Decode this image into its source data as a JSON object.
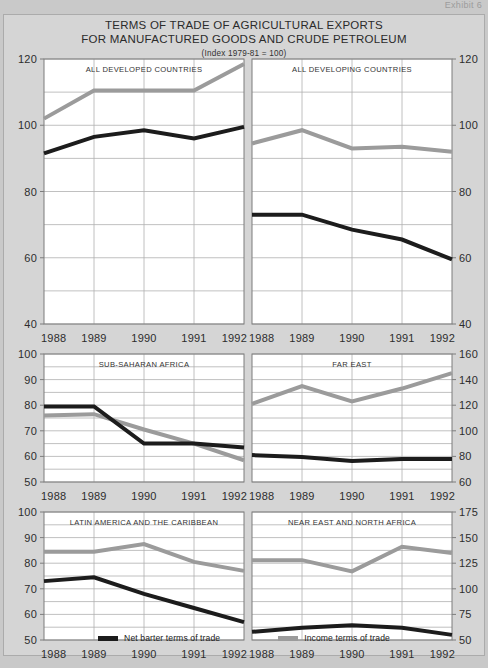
{
  "document": {
    "scan_header": "Exhibit 6",
    "title_line_1": "TERMS OF TRADE OF AGRICULTURAL EXPORTS",
    "title_line_2": "FOR MANUFACTURED GOODS AND CRUDE PETROLEUM",
    "subtitle": "(Index 1979-81 = 100)"
  },
  "colors": {
    "net_barter": "#1c1c1c",
    "income": "#9b9b9b",
    "page_background": "#c9c9c9",
    "sheet_background": "#d5d5d5",
    "plot_background": "#ffffff",
    "grid_line": "#b0b0b0",
    "frame_line": "#7d7d7d",
    "text": "#2b2b2b"
  },
  "legend": {
    "entries": [
      {
        "label": "Net barter terms of trade",
        "color": "#1c1c1c",
        "key": "net_barter"
      },
      {
        "label": "Income terms of trade",
        "color": "#9b9b9b",
        "key": "income"
      }
    ]
  },
  "chart_data": [
    {
      "id": "all-developed-countries",
      "type": "line",
      "title": "ALL DEVELOPED COUNTRIES",
      "xlabel": "",
      "ylabel": "",
      "x": [
        "1988",
        "1989",
        "1990",
        "1991",
        "1992"
      ],
      "ylim": [
        40,
        120
      ],
      "ytick_step": 20,
      "ygrid_step": 10,
      "yticks": [
        40,
        60,
        80,
        100,
        120
      ],
      "y_axis_side": "left",
      "grid": true,
      "legend_position": "figure-bottom",
      "series": [
        {
          "name": "Net barter terms of trade",
          "key": "net_barter",
          "color": "#1c1c1c",
          "values": [
            91.5,
            96.5,
            98.5,
            96.0,
            99.5
          ]
        },
        {
          "name": "Income terms of trade",
          "key": "income",
          "color": "#9b9b9b",
          "values": [
            102.0,
            110.5,
            110.5,
            110.5,
            118.5
          ]
        }
      ]
    },
    {
      "id": "all-developing-countries",
      "type": "line",
      "title": "ALL DEVELOPING COUNTRIES",
      "xlabel": "",
      "ylabel": "",
      "x": [
        "1988",
        "1989",
        "1990",
        "1991",
        "1992"
      ],
      "ylim": [
        40,
        120
      ],
      "ytick_step": 20,
      "ygrid_step": 10,
      "yticks": [
        40,
        60,
        80,
        100,
        120
      ],
      "y_axis_side": "right",
      "grid": true,
      "legend_position": "figure-bottom",
      "series": [
        {
          "name": "Net barter terms of trade",
          "key": "net_barter",
          "color": "#1c1c1c",
          "values": [
            73.0,
            73.0,
            68.5,
            65.5,
            59.5
          ]
        },
        {
          "name": "Income terms of trade",
          "key": "income",
          "color": "#9b9b9b",
          "values": [
            94.5,
            98.5,
            93.0,
            93.5,
            92.0
          ]
        }
      ]
    },
    {
      "id": "sub-saharan-africa",
      "type": "line",
      "title": "SUB-SAHARAN AFRICA",
      "xlabel": "",
      "ylabel": "",
      "x": [
        "1988",
        "1989",
        "1990",
        "1991",
        "1992"
      ],
      "ylim": [
        50,
        100
      ],
      "ytick_step": 10,
      "ygrid_step": 5,
      "yticks": [
        50,
        60,
        70,
        80,
        90,
        100
      ],
      "y_axis_side": "left",
      "grid": true,
      "legend_position": "figure-bottom",
      "series": [
        {
          "name": "Net barter terms of trade",
          "key": "net_barter",
          "color": "#1c1c1c",
          "values": [
            79.5,
            79.5,
            65.0,
            65.0,
            63.5
          ]
        },
        {
          "name": "Income terms of trade",
          "key": "income",
          "color": "#9b9b9b",
          "values": [
            76.0,
            76.5,
            70.5,
            65.0,
            58.5
          ]
        }
      ]
    },
    {
      "id": "far-east",
      "type": "line",
      "title": "FAR EAST",
      "xlabel": "",
      "ylabel": "",
      "x": [
        "1988",
        "1989",
        "1990",
        "1991",
        "1992"
      ],
      "ylim": [
        60,
        160
      ],
      "ytick_step": 20,
      "ygrid_step": 10,
      "yticks": [
        60,
        80,
        100,
        120,
        140,
        160
      ],
      "y_axis_side": "right",
      "grid": true,
      "legend_position": "figure-bottom",
      "series": [
        {
          "name": "Net barter terms of trade",
          "key": "net_barter",
          "color": "#1c1c1c",
          "values": [
            81.0,
            79.5,
            76.5,
            78.0,
            78.0
          ]
        },
        {
          "name": "Income terms of trade",
          "key": "income",
          "color": "#9b9b9b",
          "values": [
            121.0,
            135.0,
            123.0,
            133.0,
            145.0
          ]
        }
      ]
    },
    {
      "id": "latin-america-and-the-caribbean",
      "type": "line",
      "title": "LATIN AMERICA AND THE CARIBBEAN",
      "xlabel": "",
      "ylabel": "",
      "x": [
        "1988",
        "1989",
        "1990",
        "1991",
        "1992"
      ],
      "ylim": [
        50,
        100
      ],
      "ytick_step": 10,
      "ygrid_step": 5,
      "yticks": [
        50,
        60,
        70,
        80,
        90,
        100
      ],
      "y_axis_side": "left",
      "grid": true,
      "legend_position": "figure-bottom",
      "series": [
        {
          "name": "Net barter terms of trade",
          "key": "net_barter",
          "color": "#1c1c1c",
          "values": [
            73.0,
            74.5,
            68.0,
            62.5,
            57.0
          ]
        },
        {
          "name": "Income terms of trade",
          "key": "income",
          "color": "#9b9b9b",
          "values": [
            84.5,
            84.5,
            87.5,
            80.5,
            77.0
          ]
        }
      ]
    },
    {
      "id": "near-east-and-north-africa",
      "type": "line",
      "title": "NEAR EAST AND NORTH AFRICA",
      "xlabel": "",
      "ylabel": "",
      "x": [
        "1988",
        "1989",
        "1990",
        "1991",
        "1992"
      ],
      "ylim": [
        50,
        175
      ],
      "ytick_step": 25,
      "ygrid_step": 12.5,
      "yticks": [
        50,
        75,
        100,
        125,
        150,
        175
      ],
      "y_axis_side": "right",
      "grid": true,
      "legend_position": "figure-bottom",
      "series": [
        {
          "name": "Net barter terms of trade",
          "key": "net_barter",
          "color": "#1c1c1c",
          "values": [
            58.0,
            62.0,
            64.5,
            62.0,
            55.0
          ]
        },
        {
          "name": "Income terms of trade",
          "key": "income",
          "color": "#9b9b9b",
          "values": [
            128.0,
            128.0,
            117.0,
            141.0,
            135.0
          ]
        }
      ]
    }
  ],
  "layout": {
    "panels": [
      {
        "id": "all-developed-countries",
        "left": 6,
        "top": 0,
        "width": 238,
        "height": 295
      },
      {
        "id": "all-developing-countries",
        "left": 244,
        "top": 0,
        "width": 238,
        "height": 295
      },
      {
        "id": "sub-saharan-africa",
        "left": 6,
        "top": 295,
        "width": 238,
        "height": 158
      },
      {
        "id": "far-east",
        "left": 244,
        "top": 295,
        "width": 238,
        "height": 158
      },
      {
        "id": "latin-america-and-the-caribbean",
        "left": 6,
        "top": 453,
        "width": 238,
        "height": 158
      },
      {
        "id": "near-east-and-north-africa",
        "left": 244,
        "top": 453,
        "width": 238,
        "height": 158
      }
    ]
  }
}
